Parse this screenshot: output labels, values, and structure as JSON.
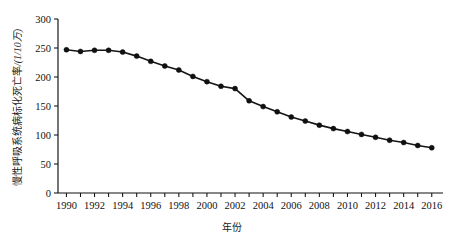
{
  "chart_data": {
    "type": "line",
    "title": "",
    "xlabel": "年份",
    "ylabel": "慢性呼吸系统病标化死亡率 /(1/10万)",
    "ylabel_main": "慢性呼吸系统病标化死亡率",
    "ylabel_unit": "/(1/10万)",
    "xlim": [
      1989.4,
      2016.8
    ],
    "ylim": [
      0,
      300
    ],
    "ytick_step": 50,
    "xtick_step": 1,
    "xticklabel_step": 2,
    "grid": false,
    "legend": false,
    "legend_position": "none",
    "marker": "filled-circle",
    "line_color": "#151515",
    "marker_color": "#101010",
    "yticks": [
      0,
      50,
      100,
      150,
      200,
      250,
      300
    ],
    "ytick_labels": [
      "0",
      "50",
      "100",
      "150",
      "200",
      "250",
      "300"
    ],
    "xticks": [
      1990,
      1991,
      1992,
      1993,
      1994,
      1995,
      1996,
      1997,
      1998,
      1999,
      2000,
      2001,
      2002,
      2003,
      2004,
      2005,
      2006,
      2007,
      2008,
      2009,
      2010,
      2011,
      2012,
      2013,
      2014,
      2015,
      2016
    ],
    "xtick_labels": [
      "1990",
      "",
      "1992",
      "",
      "1994",
      "",
      "1996",
      "",
      "1998",
      "",
      "2000",
      "",
      "2002",
      "",
      "2004",
      "",
      "2006",
      "",
      "2008",
      "",
      "2010",
      "",
      "2012",
      "",
      "2014",
      "",
      "2016"
    ],
    "x": [
      1990,
      1991,
      1992,
      1993,
      1994,
      1995,
      1996,
      1997,
      1998,
      1999,
      2000,
      2001,
      2002,
      2003,
      2004,
      2005,
      2006,
      2007,
      2008,
      2009,
      2010,
      2011,
      2012,
      2013,
      2014,
      2015,
      2016
    ],
    "values": [
      247,
      244,
      246,
      246,
      243,
      236,
      227,
      219,
      212,
      201,
      192,
      184,
      180,
      159,
      149,
      140,
      131,
      124,
      117,
      111,
      106,
      101,
      96,
      91,
      87,
      82,
      78
    ],
    "series": [
      {
        "name": "慢性呼吸系统病标化死亡率",
        "values": [
          247,
          244,
          246,
          246,
          243,
          236,
          227,
          219,
          212,
          201,
          192,
          184,
          180,
          159,
          149,
          140,
          131,
          124,
          117,
          111,
          106,
          101,
          96,
          91,
          87,
          82,
          78
        ]
      }
    ],
    "annotations": []
  }
}
